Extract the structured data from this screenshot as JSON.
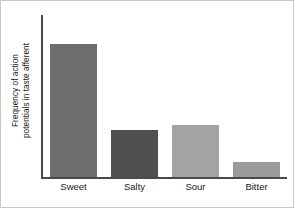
{
  "chart_data": {
    "type": "bar",
    "title": "",
    "xlabel": "",
    "ylabel_lines": [
      "Frequency of action",
      "potentials in taste afferent"
    ],
    "ylabel": "Frequency of action potentials in taste afferent",
    "categories": [
      "Sweet",
      "Salty",
      "Sour",
      "Bitter"
    ],
    "values": [
      82,
      29,
      32,
      9
    ],
    "ylim": [
      0,
      100
    ],
    "grid": false,
    "legend": false,
    "axis_ticks": "none",
    "bar_colors": [
      "#6e6e6e",
      "#4f4f4f",
      "#a3a3a3",
      "#9b9b9b"
    ],
    "axis_color": "#4a4a4a",
    "background": "#ffffff",
    "bars": [
      {
        "label": "Sweet",
        "value": 82,
        "color": "#6e6e6e"
      },
      {
        "label": "Salty",
        "value": 29,
        "color": "#4f4f4f"
      },
      {
        "label": "Sour",
        "value": 32,
        "color": "#a3a3a3"
      },
      {
        "label": "Bitter",
        "value": 9,
        "color": "#9b9b9b"
      }
    ]
  }
}
